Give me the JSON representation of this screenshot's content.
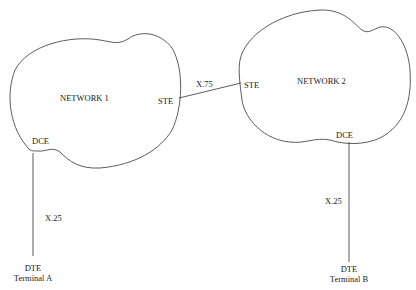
{
  "diagram": {
    "networks": [
      {
        "id": "network-1",
        "label": "NETWORK 1",
        "gateway_label": "STE",
        "access_label": "DCE"
      },
      {
        "id": "network-2",
        "label": "NETWORK 2",
        "gateway_label": "STE",
        "access_label": "DCE"
      }
    ],
    "links": [
      {
        "from": "network-1-STE",
        "to": "network-2-STE",
        "label": "X.75"
      },
      {
        "from": "terminal-a",
        "to": "network-1-DCE",
        "label": "X.25"
      },
      {
        "from": "terminal-b",
        "to": "network-2-DCE",
        "label": "X.25"
      }
    ],
    "terminals": [
      {
        "id": "terminal-a",
        "type_label": "DTE",
        "name": "Terminal A"
      },
      {
        "id": "terminal-b",
        "type_label": "DTE",
        "name": "Terminal B"
      }
    ],
    "colors": {
      "stroke": "#333333",
      "background": "#ffffff",
      "text": "#222222"
    }
  }
}
